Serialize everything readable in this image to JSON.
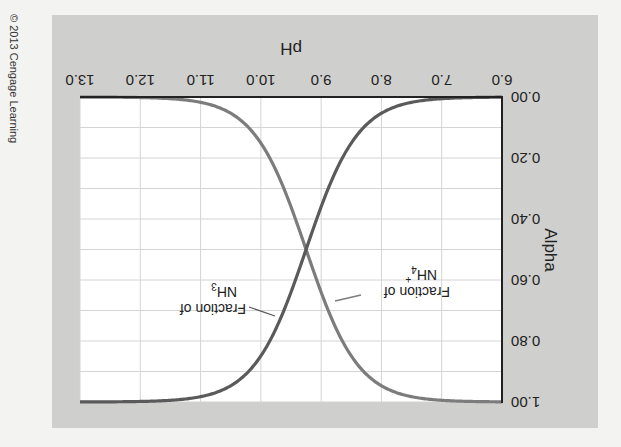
{
  "copyright": "© 2013 Cengage Learning",
  "colors": {
    "page_bg": "#f3f3f1",
    "panel_bg": "#cfcfcd",
    "plot_bg": "#ffffff",
    "grid": "#d4d4d4",
    "axis": "#222222",
    "nh3_curve": "#5a5a5a",
    "nh4_curve": "#7c7c7c",
    "text": "#222222"
  },
  "labels": {
    "nh3_line1": "Fraction of",
    "nh3_line2": "NH",
    "nh3_sub": "3",
    "nh4_line1": "Fraction of",
    "nh4_line2": "NH",
    "nh4_sub": "4",
    "nh4_sup": "+"
  },
  "chart_data": {
    "type": "line",
    "title": "",
    "xlabel": "pH",
    "ylabel": "Alpha",
    "xlim": [
      6.0,
      13.0
    ],
    "ylim": [
      0.0,
      1.0
    ],
    "x_ticks": [
      "6.0",
      "7.0",
      "8.0",
      "9.0",
      "10.0",
      "11.0",
      "12.0",
      "13.0"
    ],
    "y_ticks": [
      "0.00",
      "0.20",
      "0.40",
      "0.60",
      "0.80",
      "1.00"
    ],
    "grid": true,
    "grid_x_step": 1.0,
    "grid_y_step": 0.1,
    "orientation": "figure rotated 180 degrees",
    "x": [
      6.0,
      6.5,
      7.0,
      7.5,
      8.0,
      8.5,
      9.0,
      9.25,
      9.5,
      10.0,
      10.5,
      11.0,
      11.5,
      12.0,
      12.5,
      13.0
    ],
    "series": [
      {
        "name": "Fraction of NH4+",
        "values": [
          1.0,
          1.0,
          0.99,
          0.98,
          0.95,
          0.85,
          0.64,
          0.5,
          0.36,
          0.15,
          0.05,
          0.02,
          0.01,
          0.0,
          0.0,
          0.0
        ]
      },
      {
        "name": "Fraction of NH3",
        "values": [
          0.0,
          0.0,
          0.01,
          0.02,
          0.05,
          0.15,
          0.36,
          0.5,
          0.64,
          0.85,
          0.95,
          0.98,
          0.99,
          1.0,
          1.0,
          1.0
        ]
      }
    ],
    "annotations": [
      "Fraction of NH3",
      "Fraction of NH4+",
      "crossover at pH ≈ 9.25, alpha = 0.50"
    ]
  }
}
